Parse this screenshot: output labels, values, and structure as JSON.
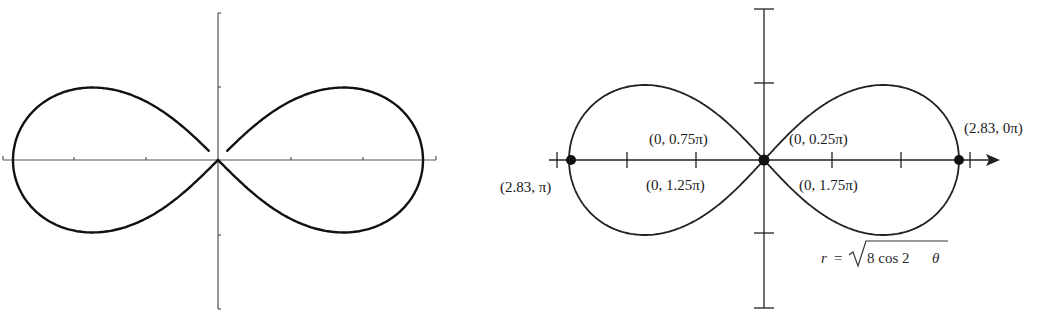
{
  "figure": {
    "left_panel": {
      "description": "Lemniscate drawn with parametric pieces, unlabeled axes",
      "curve": "lemniscate",
      "axis_ticks_x": 4,
      "axis_ticks_y": 2
    },
    "right_panel": {
      "equation": {
        "lhs": "r",
        "eq": "=",
        "radicand": "8 cos 2",
        "theta": "θ"
      },
      "points": [
        {
          "id": "p-left",
          "label": "(2.83, π)"
        },
        {
          "id": "p-origin-075",
          "label": "(0, 0.75π)"
        },
        {
          "id": "p-origin-125",
          "label": "(0, 1.25π)"
        },
        {
          "id": "p-origin-025",
          "label": "(0, 0.25π)"
        },
        {
          "id": "p-origin-175",
          "label": "(0, 1.75π)"
        },
        {
          "id": "p-right",
          "label": "(2.83, 0π)"
        }
      ]
    }
  },
  "chart_data": [
    {
      "type": "line",
      "title": "",
      "curve": "lemniscate r^2 = 8 cos 2θ (polar)",
      "xlabel": "",
      "ylabel": "",
      "grid": false,
      "x_extent": [
        -2.83,
        2.83
      ],
      "y_extent": [
        -1.0,
        1.0
      ]
    },
    {
      "type": "line",
      "title": "",
      "equation": "r = √(8 cos 2θ)",
      "curve": "lemniscate (polar)",
      "grid": false,
      "annotated_points": [
        {
          "r": 2.83,
          "theta": "π",
          "label": "(2.83, π)"
        },
        {
          "r": 0,
          "theta": "0.75π",
          "label": "(0, 0.75π)"
        },
        {
          "r": 0,
          "theta": "1.25π",
          "label": "(0, 1.25π)"
        },
        {
          "r": 0,
          "theta": "0.25π",
          "label": "(0, 0.25π)"
        },
        {
          "r": 0,
          "theta": "1.75π",
          "label": "(0, 1.75π)"
        },
        {
          "r": 2.83,
          "theta": "0π",
          "label": "(2.83, 0π)"
        }
      ],
      "marked_dots": [
        "(2.83, π)",
        "(0, origin)",
        "(2.83, 0π)"
      ]
    }
  ]
}
